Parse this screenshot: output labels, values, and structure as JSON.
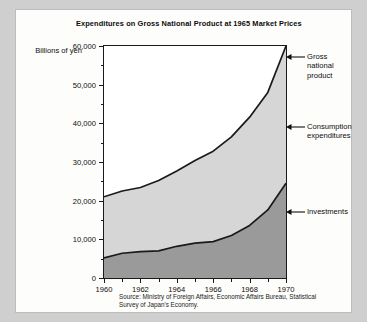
{
  "figure": {
    "title": "Expenditures on Gross National Product\nat 1965 Market Prices",
    "unit_label": "Billions of\nyen",
    "source": "Source: Ministry of Foreign Affairs, Economic Affairs Bureau,\nStatistical Survey of Japan's Economy."
  },
  "annotations": {
    "gnp": "Gross\nnational\nproduct",
    "consumption": "Consumption\nexpenditures",
    "investments": "Investments"
  },
  "colors": {
    "page_background": "#cfcfcf",
    "figure_background": "#fdfdfb",
    "axis": "#1a1a1a",
    "consumption_fill": "#d6d6d6",
    "investments_fill": "#9a9a9a",
    "text": "#0d0d0d"
  },
  "chart_data": {
    "type": "area",
    "stacked": true,
    "title": "Expenditures on Gross National Product at 1965 Market Prices",
    "xlabel": "",
    "ylabel": "Billions of yen",
    "xlim": [
      1960,
      1970
    ],
    "ylim": [
      0,
      60000
    ],
    "ytick_labels": [
      "0",
      "10,000",
      "20,000",
      "30,000",
      "40,000",
      "50,000",
      "60,000"
    ],
    "ytick_values": [
      0,
      10000,
      20000,
      30000,
      40000,
      50000,
      60000
    ],
    "yminor_values": [
      5000,
      15000,
      25000,
      35000,
      45000,
      55000
    ],
    "xtick_labels": [
      "1960",
      "1962",
      "1964",
      "1966",
      "1968",
      "1970"
    ],
    "xtick_values": [
      1960,
      1962,
      1964,
      1966,
      1968,
      1970
    ],
    "xminor_values": [
      1961,
      1963,
      1965,
      1967,
      1969
    ],
    "grid": false,
    "legend": "annotated at right",
    "x": [
      1960,
      1961,
      1962,
      1963,
      1964,
      1965,
      1966,
      1967,
      1968,
      1969,
      1970
    ],
    "series": [
      {
        "name": "Investments",
        "values": [
          5200,
          6400,
          6800,
          7000,
          8200,
          9000,
          9400,
          11000,
          13600,
          17600,
          24500
        ]
      },
      {
        "name": "Consumption expenditures",
        "values": [
          15800,
          16100,
          16600,
          18200,
          19500,
          21400,
          23400,
          25500,
          28000,
          30400,
          35500
        ]
      }
    ],
    "totals": {
      "name": "Gross national product",
      "values": [
        21000,
        22500,
        23400,
        25200,
        27700,
        30400,
        32800,
        36500,
        41600,
        48000,
        60000
      ]
    }
  }
}
